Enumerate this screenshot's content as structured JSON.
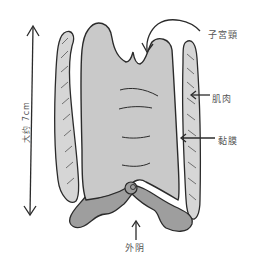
{
  "diagram": {
    "labels": {
      "cervix": "子宮頸",
      "muscle": "肌肉",
      "mucosa": "黏膜",
      "vulva": "外阴",
      "length": "大约 7cm"
    },
    "colors": {
      "outline": "#2b2b2b",
      "canal_fill": "#c9c9c9",
      "muscle_fill": "#d6d6d6",
      "vulva_fill": "#9e9e9e",
      "label_text": "#555555",
      "background": "#ffffff"
    }
  }
}
